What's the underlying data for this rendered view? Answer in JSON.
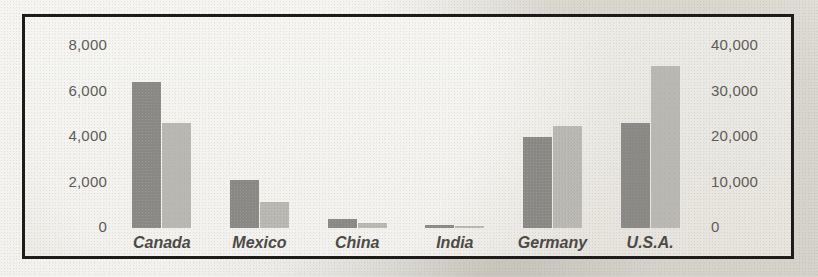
{
  "chart_data": {
    "type": "bar",
    "title": "",
    "subtitle": "",
    "xlabel": "",
    "grid": false,
    "legend": "none",
    "categories": [
      "Canada",
      "Mexico",
      "China",
      "India",
      "Germany",
      "U.S.A."
    ],
    "series": [
      {
        "name": "primary-series",
        "axis": "left",
        "color": "#8a8985",
        "values": [
          6400,
          2100,
          400,
          150,
          4000,
          4600
        ]
      },
      {
        "name": "secondary-series",
        "axis": "right",
        "color": "#b9b8b2",
        "values": [
          23000,
          5700,
          1200,
          300,
          22500,
          35700
        ]
      }
    ],
    "left_axis": {
      "ylabel": "",
      "ylim": [
        0,
        8000
      ],
      "ticks": [
        0,
        2000,
        4000,
        6000,
        8000
      ],
      "tick_labels": [
        "0",
        "2,000",
        "4,000",
        "6,000",
        "8,000"
      ]
    },
    "right_axis": {
      "ylabel": "",
      "ylim": [
        0,
        40000
      ],
      "ticks": [
        0,
        10000,
        20000,
        30000,
        40000
      ],
      "tick_labels": [
        "0",
        "10,000",
        "20,000",
        "30,000",
        "40,000"
      ]
    },
    "colors": {
      "primary_bar": "#8a8985",
      "secondary_bar": "#b9b8b2",
      "frame": "#1c1b19",
      "tick_text": "#5e5c57",
      "category_text": "#4c4a46",
      "background": "#e9e7e1"
    }
  }
}
